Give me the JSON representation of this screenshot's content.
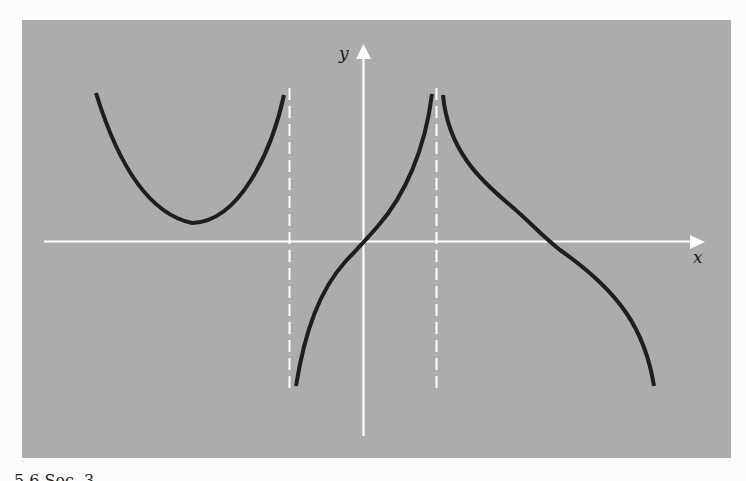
{
  "figure": {
    "background_color": "#acacac",
    "axis_color": "#ffffff",
    "curve_color": "#1e1e1e",
    "x_axis_label": "x",
    "y_axis_label": "y",
    "caption_partial": "5.6 Sec. 3"
  },
  "diagram": {
    "type": "function graph with vertical asymptotes",
    "axes": {
      "x_axis": {
        "label": "x",
        "direction": "right arrow"
      },
      "y_axis": {
        "label": "y",
        "direction": "up arrow"
      }
    },
    "asymptotes": [
      {
        "type": "vertical",
        "style": "dashed",
        "position": "left of y-axis"
      },
      {
        "type": "vertical",
        "style": "dashed",
        "position": "right of y-axis"
      }
    ],
    "branches": [
      {
        "region": "left of left asymptote",
        "shape": "U-shaped, opening upward, minimum above x-axis"
      },
      {
        "region": "between asymptotes",
        "shape": "increasing, passes through origin, from -inf to +inf"
      },
      {
        "region": "right of right asymptote",
        "shape": "decreasing, crosses x-axis, from +inf downward"
      }
    ]
  }
}
